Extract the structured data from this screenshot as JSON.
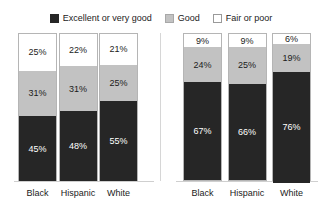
{
  "legend": {
    "items": [
      {
        "label": "Excellent or very good",
        "swatch": "dark-square-icon",
        "color": "#262626"
      },
      {
        "label": "Good",
        "swatch": "gray-square-icon",
        "color": "#c2c2c2"
      },
      {
        "label": "Fair or poor",
        "swatch": "white-square-icon",
        "color": "#ffffff"
      }
    ]
  },
  "chart_data": {
    "type": "bar",
    "subtype": "100% stacked bar",
    "title": "",
    "xlabel": "",
    "ylabel": "",
    "ylim": [
      0,
      100
    ],
    "grid": false,
    "legend_position": "top-center",
    "unit": "%",
    "series": [
      {
        "name": "Excellent or very good",
        "color": "#262626"
      },
      {
        "name": "Good",
        "color": "#c2c2c2"
      },
      {
        "name": "Fair or poor",
        "color": "#ffffff"
      }
    ],
    "panels": [
      {
        "name": "panel-1",
        "categories": [
          "Black",
          "Hispanic",
          "White"
        ],
        "bars": [
          {
            "category": "Black",
            "segments": [
              {
                "series": "Fair or poor",
                "value": 25,
                "label": "25%"
              },
              {
                "series": "Good",
                "value": 31,
                "label": "31%"
              },
              {
                "series": "Excellent or very good",
                "value": 45,
                "label": "45%"
              }
            ]
          },
          {
            "category": "Hispanic",
            "segments": [
              {
                "series": "Fair or poor",
                "value": 22,
                "label": "22%"
              },
              {
                "series": "Good",
                "value": 31,
                "label": "31%"
              },
              {
                "series": "Excellent or very good",
                "value": 48,
                "label": "48%"
              }
            ]
          },
          {
            "category": "White",
            "segments": [
              {
                "series": "Fair or poor",
                "value": 21,
                "label": "21%"
              },
              {
                "series": "Good",
                "value": 25,
                "label": "25%"
              },
              {
                "series": "Excellent or very good",
                "value": 55,
                "label": "55%"
              }
            ]
          }
        ]
      },
      {
        "name": "panel-2",
        "categories": [
          "Black",
          "Hispanic",
          "White"
        ],
        "bars": [
          {
            "category": "Black",
            "segments": [
              {
                "series": "Fair or poor",
                "value": 9,
                "label": "9%"
              },
              {
                "series": "Good",
                "value": 24,
                "label": "24%"
              },
              {
                "series": "Excellent or very good",
                "value": 67,
                "label": "67%"
              }
            ]
          },
          {
            "category": "Hispanic",
            "segments": [
              {
                "series": "Fair or poor",
                "value": 9,
                "label": "9%"
              },
              {
                "series": "Good",
                "value": 25,
                "label": "25%"
              },
              {
                "series": "Excellent or very good",
                "value": 66,
                "label": "66%"
              }
            ]
          },
          {
            "category": "White",
            "segments": [
              {
                "series": "Fair or poor",
                "value": 6,
                "label": "6%"
              },
              {
                "series": "Good",
                "value": 19,
                "label": "19%"
              },
              {
                "series": "Excellent or very good",
                "value": 76,
                "label": "76%"
              }
            ]
          }
        ]
      }
    ]
  }
}
